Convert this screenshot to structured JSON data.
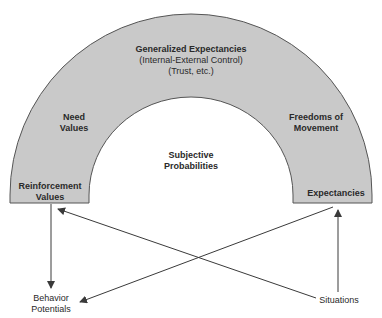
{
  "colors": {
    "arch_fill": "#c9c9c9",
    "arch_stroke": "#555555",
    "arrow": "#3a3a3a",
    "text": "#2a2a2a"
  },
  "arch": {
    "top_title": "Generalized Expectancies",
    "top_line2": "(Internal-External Control)",
    "top_line3": "(Trust, etc.)",
    "left_mid_line1": "Need",
    "left_mid_line2": "Values",
    "left_base_line1": "Reinforcement",
    "left_base_line2": "Values",
    "right_mid_line1": "Freedoms of",
    "right_mid_line2": "Movement",
    "right_base": "Expectancies"
  },
  "center": {
    "line1": "Subjective",
    "line2": "Probabilities"
  },
  "nodes": {
    "behavior_line1": "Behavior",
    "behavior_line2": "Potentials",
    "situations": "Situations"
  },
  "arrows": [
    {
      "from": "Reinforcement Values",
      "to": "Behavior Potentials"
    },
    {
      "from": "Situations",
      "to": "Reinforcement Values"
    },
    {
      "from": "Expectancies",
      "to": "Behavior Potentials"
    },
    {
      "from": "Situations",
      "to": "Expectancies"
    }
  ]
}
